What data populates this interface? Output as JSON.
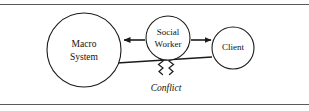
{
  "figure": {
    "background_color": "#ffffff",
    "stroke_color": "#1b1b1b",
    "rule_color": "#5a5a5a",
    "width": 309,
    "height": 111
  },
  "nodes": {
    "macro_system": {
      "label_line1": "Macro",
      "label_line2": "System",
      "shape": "circle",
      "cx": 84,
      "cy": 50,
      "r": 37
    },
    "social_worker": {
      "label_line1": "Social",
      "label_line2": "Worker",
      "shape": "circle",
      "cx": 168,
      "cy": 38,
      "r": 22
    },
    "client": {
      "label_line1": "Client",
      "shape": "circle",
      "cx": 233,
      "cy": 48,
      "r": 21
    }
  },
  "edges": {
    "worker_to_macro": {
      "name": "arrow-left",
      "direction": "left",
      "from": "social_worker",
      "to": "macro_system"
    },
    "worker_to_client": {
      "name": "arrow-right",
      "direction": "right",
      "from": "social_worker",
      "to": "client"
    },
    "macro_to_client": {
      "name": "conflict-link",
      "from": "macro_system",
      "to": "client",
      "label": "Conflict",
      "break_symbol": "double-zigzag"
    }
  },
  "rules": {
    "top": "horizontal-rule-top",
    "bottom": "horizontal-rule-bottom"
  }
}
